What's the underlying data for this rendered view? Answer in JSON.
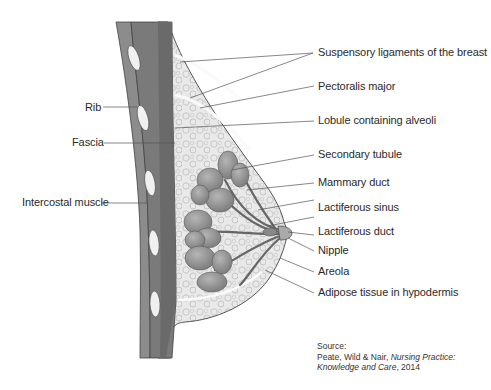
{
  "diagram": {
    "type": "anatomical cross-section",
    "labels_right": [
      {
        "id": "suspensory",
        "text": "Suspensory ligaments of the breast"
      },
      {
        "id": "pectoralis",
        "text": "Pectoralis major"
      },
      {
        "id": "lobule",
        "text": "Lobule containing alveoli"
      },
      {
        "id": "secondary",
        "text": "Secondary tubule"
      },
      {
        "id": "mammary",
        "text": "Mammary duct"
      },
      {
        "id": "sinus",
        "text": "Lactiferous sinus"
      },
      {
        "id": "lactduct",
        "text": "Lactiferous duct"
      },
      {
        "id": "nipple",
        "text": "Nipple"
      },
      {
        "id": "areola",
        "text": "Areola"
      },
      {
        "id": "adipose",
        "text": "Adipose tissue in hypodermis"
      }
    ],
    "labels_left": [
      {
        "id": "rib",
        "text": "Rib"
      },
      {
        "id": "fascia",
        "text": "Fascia"
      },
      {
        "id": "intercostal",
        "text": "Intercostal muscle"
      }
    ],
    "source": {
      "heading": "Source:",
      "authors": "Peate, Wild & Nair, ",
      "title": "Nursing Practice: Knowledge and Care",
      "year": ", 2014"
    },
    "colors": {
      "muscle_outer": "#8c8c8c",
      "muscle_inner": "#6e6e6e",
      "fat": "#e6e6e6",
      "gland": "#8a8a8a",
      "line": "#555555"
    }
  }
}
